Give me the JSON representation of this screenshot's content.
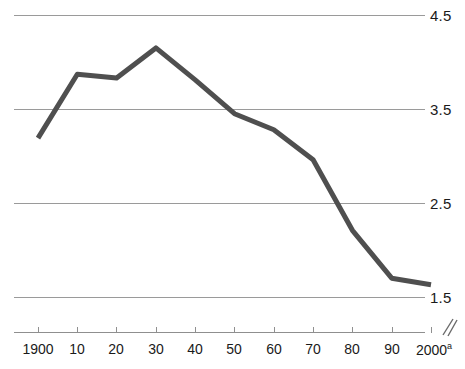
{
  "chart_data": {
    "type": "line",
    "title": "",
    "subtitle": "",
    "xlabel": "",
    "ylabel": "",
    "x": [
      1900,
      1910,
      1920,
      1930,
      1940,
      1950,
      1960,
      1970,
      1980,
      1990,
      2000
    ],
    "categories": [
      "1900",
      "10",
      "20",
      "30",
      "40",
      "50",
      "60",
      "70",
      "80",
      "90",
      "2000"
    ],
    "values": [
      3.19,
      3.87,
      3.83,
      4.15,
      3.81,
      3.45,
      3.28,
      2.96,
      2.21,
      1.7,
      1.63
    ],
    "series": [
      {
        "name": "",
        "values": [
          3.19,
          3.87,
          3.83,
          4.15,
          3.81,
          3.45,
          3.28,
          2.96,
          2.21,
          1.7,
          1.63
        ],
        "color": "#4f4f4f"
      }
    ],
    "ylim": [
      1.5,
      4.5
    ],
    "xlim": [
      1900,
      2000
    ],
    "y_ticks": [
      4.5,
      3.5,
      2.5,
      1.5
    ],
    "y_tick_labels": [
      "4.5",
      "3.5",
      "2.5",
      "1.5"
    ],
    "x_tick_labels": [
      "1900",
      "10",
      "20",
      "30",
      "40",
      "50",
      "60",
      "70",
      "80",
      "90",
      "2000"
    ],
    "x_last_label_superscript": "a",
    "grid": true,
    "grid_color": "#9a9a9a",
    "legend": false,
    "legend_position": "none",
    "axis_break_marker": "double-slash",
    "y_axis_position": "right",
    "annotations": []
  },
  "axis": {
    "y_labels": [
      "4.5",
      "3.5",
      "2.5",
      "1.5"
    ],
    "x_labels": [
      {
        "text": "1900",
        "sup": ""
      },
      {
        "text": "10",
        "sup": ""
      },
      {
        "text": "20",
        "sup": ""
      },
      {
        "text": "30",
        "sup": ""
      },
      {
        "text": "40",
        "sup": ""
      },
      {
        "text": "50",
        "sup": ""
      },
      {
        "text": "60",
        "sup": ""
      },
      {
        "text": "70",
        "sup": ""
      },
      {
        "text": "80",
        "sup": ""
      },
      {
        "text": "90",
        "sup": ""
      },
      {
        "text": "2000",
        "sup": "a"
      }
    ]
  },
  "colors": {
    "line": "#4f4f4f",
    "grid": "#9a9a9a",
    "axis": "#8f8f8f",
    "text": "#1a1a1a",
    "background": "#ffffff"
  }
}
